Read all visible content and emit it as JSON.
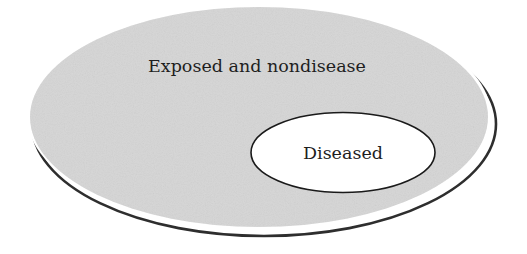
{
  "diagram": {
    "type": "nested-ellipse",
    "outer": {
      "label": "Exposed and nondisease",
      "fill": "#d6d6d6",
      "shadow_color": "#2e2e2e"
    },
    "inner": {
      "label": "Diseased",
      "fill": "#ffffff",
      "stroke": "#1a1a1a"
    }
  }
}
